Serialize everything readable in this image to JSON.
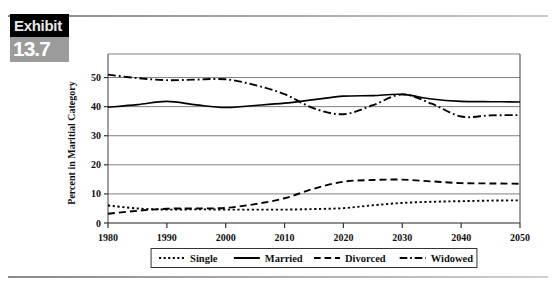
{
  "exhibit": {
    "word": "Exhibit",
    "number": "13.7",
    "black_color": "#000000",
    "gray_color": "#9b9b9b"
  },
  "chart_data": {
    "type": "line",
    "title": "",
    "xlabel": "",
    "ylabel": "Percent in Maritial Category",
    "x": [
      1980,
      1985,
      1990,
      1995,
      2000,
      2005,
      2010,
      2015,
      2020,
      2025,
      2030,
      2035,
      2040,
      2045,
      2050
    ],
    "xlim": [
      1980,
      2050
    ],
    "ylim": [
      0,
      55
    ],
    "xticks": [
      1980,
      1990,
      2000,
      2010,
      2020,
      2030,
      2040,
      2050
    ],
    "yticks": [
      0,
      10,
      20,
      30,
      40,
      50
    ],
    "grid": true,
    "legend_position": "bottom",
    "series": [
      {
        "name": "Single",
        "style": "dotted",
        "color": "#000000",
        "values": [
          6.0,
          5.0,
          4.6,
          4.7,
          4.6,
          4.6,
          4.6,
          4.8,
          5.1,
          6.1,
          6.9,
          7.3,
          7.5,
          7.7,
          7.8
        ]
      },
      {
        "name": "Married",
        "style": "solid",
        "color": "#000000",
        "values": [
          39.8,
          40.7,
          41.8,
          40.6,
          39.7,
          40.4,
          41.2,
          42.4,
          43.6,
          43.8,
          44.2,
          42.6,
          41.8,
          41.7,
          41.6
        ]
      },
      {
        "name": "Divorced",
        "style": "dashed",
        "color": "#000000",
        "values": [
          3.2,
          4.2,
          4.9,
          5.0,
          5.2,
          6.5,
          8.5,
          11.8,
          14.2,
          14.8,
          14.9,
          14.3,
          13.7,
          13.6,
          13.5
        ]
      },
      {
        "name": "Widowed",
        "style": "dashdot",
        "color": "#000000",
        "values": [
          51.0,
          49.8,
          49.1,
          49.3,
          49.4,
          47.4,
          44.3,
          39.4,
          37.4,
          40.5,
          44.2,
          41.0,
          36.6,
          37.0,
          37.1
        ]
      }
    ]
  },
  "legend": {
    "items": [
      {
        "label": "Single",
        "style": "dotted"
      },
      {
        "label": "Married",
        "style": "solid"
      },
      {
        "label": "Divorced",
        "style": "dashed"
      },
      {
        "label": "Widowed",
        "style": "dashdot"
      }
    ]
  }
}
